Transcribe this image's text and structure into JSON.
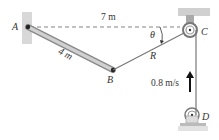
{
  "diagram": {
    "points": {
      "A": "A",
      "B": "B",
      "C": "C",
      "D": "D"
    },
    "labels": {
      "distance_AC": "7 m",
      "length_AB": "4 m",
      "rope_label": "R",
      "angle": "θ",
      "velocity": "0.8 m/s"
    },
    "colors": {
      "bar": "#b8b8b8",
      "wall": "#d4d4d4",
      "line": "#555555"
    }
  }
}
